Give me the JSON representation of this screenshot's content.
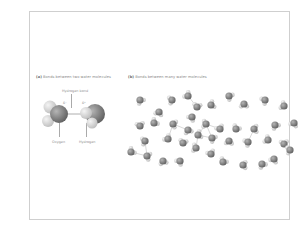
{
  "figure": {
    "panel_a": {
      "caption_letter": "(a)",
      "caption_text": "Bonds between two water molecules",
      "labels": {
        "hydrogen_bond": "Hydrogen bond",
        "oxygen": "Oxygen",
        "hydrogen": "Hydrogen",
        "delta_minus": "δ⁻",
        "delta_plus": "δ⁺"
      }
    },
    "panel_b": {
      "caption_letter": "(b)",
      "caption_text": "Bonds between many water molecules"
    },
    "colors": {
      "oxygen": "#7a7a7a",
      "hydrogen": "#d8d8d8",
      "bond_line": "#b0b0b0",
      "frame_border": "#cfcfcf",
      "caption": "#8a8a8a"
    },
    "molecules_b": [
      [
        12,
        14
      ],
      [
        31,
        26
      ],
      [
        44,
        14
      ],
      [
        60,
        10
      ],
      [
        69,
        21
      ],
      [
        83,
        19
      ],
      [
        101,
        10
      ],
      [
        116,
        18
      ],
      [
        137,
        14
      ],
      [
        156,
        20
      ],
      [
        12,
        40
      ],
      [
        26,
        37
      ],
      [
        45,
        38
      ],
      [
        60,
        44
      ],
      [
        64,
        31
      ],
      [
        78,
        38
      ],
      [
        92,
        43
      ],
      [
        108,
        43
      ],
      [
        126,
        43
      ],
      [
        147,
        39
      ],
      [
        166,
        37
      ],
      [
        17,
        55
      ],
      [
        40,
        53
      ],
      [
        55,
        57
      ],
      [
        70,
        49
      ],
      [
        84,
        52
      ],
      [
        101,
        55
      ],
      [
        120,
        56
      ],
      [
        140,
        54
      ],
      [
        156,
        58
      ],
      [
        3,
        66
      ],
      [
        19,
        70
      ],
      [
        35,
        75
      ],
      [
        52,
        75
      ],
      [
        68,
        62
      ],
      [
        83,
        68
      ],
      [
        95,
        76
      ],
      [
        115,
        79
      ],
      [
        134,
        78
      ],
      [
        146,
        73
      ],
      [
        162,
        64
      ]
    ]
  }
}
